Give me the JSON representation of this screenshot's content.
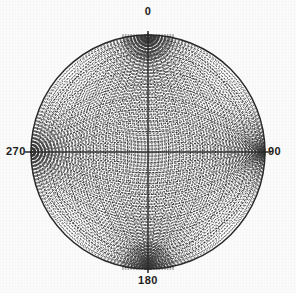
{
  "figure": {
    "kind": "stereonet",
    "background_color": "#fbfbfb",
    "line_color": "#2a2a2a",
    "grid_color": "#3a3a3a"
  },
  "labels": {
    "top": "0",
    "right": "90",
    "bottom": "180",
    "left": "270"
  },
  "chart_data": {
    "type": "scatter",
    "title": "",
    "xlabel": "",
    "ylabel": "",
    "projection": "stereographic",
    "net_type": "equal-angle (Wulff)",
    "center_x_px": 148,
    "center_y_px": 152,
    "radius_px": 117,
    "grid": true,
    "grid_interval_degrees": 2,
    "major_grid_interval_degrees": 10,
    "azimuth_ticks": [
      0,
      90,
      180,
      270
    ],
    "azimuth_tick_labels": [
      "0",
      "90",
      "180",
      "270"
    ],
    "axis_lines": [
      "horizontal 270-90",
      "vertical 0-180"
    ],
    "great_circle_dip_degrees": [
      2,
      4,
      6,
      8,
      10,
      12,
      14,
      16,
      18,
      20,
      22,
      24,
      26,
      28,
      30,
      32,
      34,
      36,
      38,
      40,
      42,
      44,
      46,
      48,
      50,
      52,
      54,
      56,
      58,
      60,
      62,
      64,
      66,
      68,
      70,
      72,
      74,
      76,
      78,
      80,
      82,
      84,
      86,
      88
    ],
    "small_circle_cone_degrees": [
      2,
      4,
      6,
      8,
      10,
      12,
      14,
      16,
      18,
      20,
      22,
      24,
      26,
      28,
      30,
      32,
      34,
      36,
      38,
      40,
      42,
      44,
      46,
      48,
      50,
      52,
      54,
      56,
      58,
      60,
      62,
      64,
      66,
      68,
      70,
      72,
      74,
      76,
      78,
      80,
      82,
      84,
      86,
      88
    ],
    "primitive_circle": true,
    "legend": [],
    "series": [],
    "x": [],
    "values": [],
    "xlim": [
      -1,
      1
    ],
    "ylim": [
      -1,
      1
    ]
  }
}
